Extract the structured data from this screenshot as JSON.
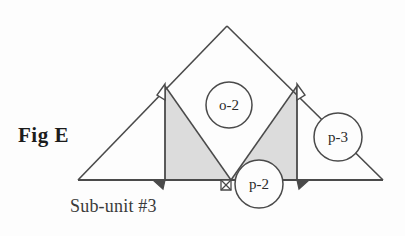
{
  "figure": {
    "label": "Fig E",
    "caption": "Sub-unit #3",
    "background_color": "#fdfdfd",
    "line_color": "#4a4a4a",
    "shade_color": "#dcdcdc",
    "text_color": "#2b2b2b"
  },
  "nodes": [
    {
      "id": "o-2",
      "label": "o-2",
      "cx": 229,
      "cy": 105,
      "r": 23
    },
    {
      "id": "p-2",
      "label": "p-2",
      "cx": 259,
      "cy": 184,
      "r": 24
    },
    {
      "id": "p-3",
      "label": "p-3",
      "cx": 338,
      "cy": 137,
      "r": 24
    }
  ],
  "diagram": {
    "type": "geometric-line-diagram",
    "baseline": {
      "x1": 78,
      "y1": 180,
      "x2": 383,
      "y2": 180
    },
    "apex": {
      "x": 227,
      "y": 26
    },
    "left_vertical": {
      "x": 165,
      "y_top": 86,
      "y_bottom": 180
    },
    "right_vertical": {
      "x": 297,
      "y_top": 86,
      "y_bottom": 180
    },
    "mid_base_point": {
      "x": 231,
      "y": 180
    },
    "shaded_triangles": [
      {
        "name": "left-shaded-triangle",
        "points": "165,86 165,180 231,180"
      },
      {
        "name": "right-shaded-triangle",
        "points": "297,86 297,180 231,180"
      }
    ],
    "markers": [
      {
        "name": "arrowhead-left-top",
        "x": 165,
        "y": 86,
        "direction": "up"
      },
      {
        "name": "arrowhead-left-bottom",
        "x": 165,
        "y": 180,
        "direction": "down"
      },
      {
        "name": "arrowhead-mid-bottom",
        "x": 231,
        "y": 180,
        "direction": "down"
      },
      {
        "name": "arrowhead-right-top",
        "x": 297,
        "y": 86,
        "direction": "up"
      },
      {
        "name": "arrowhead-right-bottom",
        "x": 297,
        "y": 180,
        "direction": "down"
      }
    ]
  }
}
